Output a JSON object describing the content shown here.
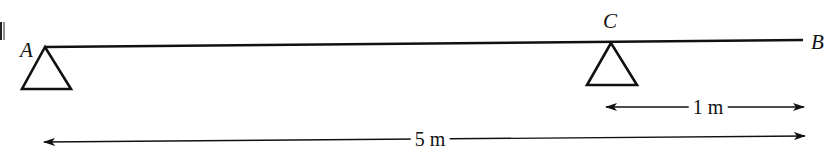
{
  "diagram": {
    "type": "beam-supports",
    "beam": {
      "from": "A",
      "to": "B"
    },
    "points": [
      {
        "id": "A",
        "label": "A",
        "support": "triangle"
      },
      {
        "id": "C",
        "label": "C",
        "support": "triangle"
      },
      {
        "id": "B",
        "label": "B",
        "support": "none"
      }
    ],
    "dimensions": [
      {
        "id": "CB",
        "from": "C",
        "to": "B",
        "label": "1 m"
      },
      {
        "id": "AB",
        "from": "A",
        "to": "B",
        "label": "5 m"
      }
    ],
    "colors": {
      "line": "#111111",
      "background": "#ffffff"
    }
  },
  "labels": {
    "a": "A",
    "b": "B",
    "c": "C",
    "dim_1m": "1 m",
    "dim_5m": "5 m",
    "clipped_glyph": "N"
  }
}
